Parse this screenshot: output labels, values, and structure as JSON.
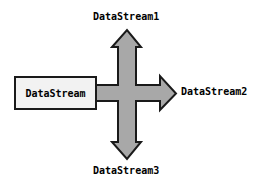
{
  "diagram": {
    "source_box": {
      "label": "DataStream",
      "fill_color": "#F2F2F2",
      "stroke_color": "#1A1A1A"
    },
    "arrow_style": {
      "fill_color": "#A8A8A8",
      "stroke_color": "#1A1A1A",
      "stroke_width": 2
    },
    "branches": [
      {
        "id": "stream1",
        "label": "DataStream1",
        "direction": "up"
      },
      {
        "id": "stream2",
        "label": "DataStream2",
        "direction": "right"
      },
      {
        "id": "stream3",
        "label": "DataStream3",
        "direction": "down"
      }
    ]
  }
}
